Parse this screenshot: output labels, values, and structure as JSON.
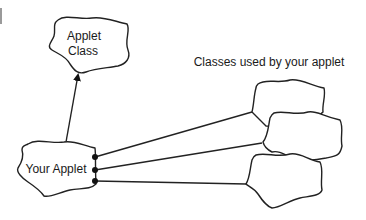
{
  "diagram": {
    "type": "class-dependency-diagram",
    "nodes": {
      "applet_class": {
        "line1": "Applet",
        "line2": "Class"
      },
      "your_applet": {
        "label": "Your Applet"
      },
      "used_classes": {
        "count": 3,
        "labels": [
          "",
          "",
          ""
        ]
      }
    },
    "annotations": {
      "used_classes_caption": "Classes used by your applet"
    },
    "edges": [
      {
        "from": "your_applet",
        "to": "applet_class",
        "style": "arrow"
      },
      {
        "from": "your_applet",
        "to": "used_class_1",
        "style": "line-with-dot"
      },
      {
        "from": "your_applet",
        "to": "used_class_2",
        "style": "line-with-dot"
      },
      {
        "from": "your_applet",
        "to": "used_class_3",
        "style": "line-with-dot"
      }
    ],
    "colors": {
      "stroke": "#222222",
      "background": "#ffffff",
      "text": "#1a1a1a"
    }
  }
}
